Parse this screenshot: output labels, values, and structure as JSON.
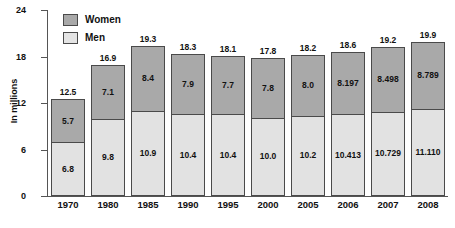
{
  "chart_data": {
    "type": "bar",
    "subtype": "stacked-vertical",
    "title": "",
    "xlabel": "",
    "ylabel": "In millions",
    "ylim": [
      0,
      24
    ],
    "yticks": [
      "0",
      "6",
      "12",
      "18",
      "24"
    ],
    "ytick_values": [
      0,
      6,
      12,
      18,
      24
    ],
    "grid": false,
    "legend_position": "top-left",
    "categories": [
      "1970",
      "1980",
      "1985",
      "1990",
      "1995",
      "2000",
      "2005",
      "2006",
      "2007",
      "2008"
    ],
    "series": [
      {
        "name": "Women",
        "color": "#a9a9a9",
        "values": [
          5.7,
          7.1,
          8.4,
          7.9,
          7.7,
          7.8,
          8.0,
          8.197,
          8.498,
          8.789
        ],
        "labels": [
          "5.7",
          "7.1",
          "8.4",
          "7.9",
          "7.7",
          "7.8",
          "8.0",
          "8.197",
          "8.498",
          "8.789"
        ]
      },
      {
        "name": "Men",
        "color": "#e2e2e2",
        "values": [
          6.8,
          9.8,
          10.9,
          10.4,
          10.4,
          10.0,
          10.2,
          10.413,
          10.729,
          11.11
        ],
        "labels": [
          "6.8",
          "9.8",
          "10.9",
          "10.4",
          "10.4",
          "10.0",
          "10.2",
          "10.413",
          "10.729",
          "11.110"
        ]
      }
    ],
    "totals": [
      12.5,
      16.9,
      19.3,
      18.3,
      18.1,
      17.8,
      18.2,
      18.6,
      19.2,
      19.9
    ],
    "total_labels": [
      "12.5",
      "16.9",
      "19.3",
      "18.3",
      "18.1",
      "17.8",
      "18.2",
      "18.6",
      "19.2",
      "19.9"
    ]
  },
  "legend": {
    "items": [
      {
        "label": "Women",
        "swatch": "women-swatch"
      },
      {
        "label": "Men",
        "swatch": "men-swatch"
      }
    ]
  },
  "axis": {
    "y_title": "In millions"
  }
}
